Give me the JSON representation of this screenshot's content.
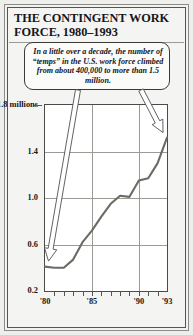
{
  "figure": {
    "title": "THE CONTINGENT WORK FORCE, 1980–1993",
    "callout": "In a little over a decade, the number of “temps” in the U.S. work force climbed from about 400,000 to more than 1.5 million.",
    "background_color": "#f2f2f0",
    "plot_background_color": "#ffffff",
    "line_color": "#6b6b66",
    "grid_color": "#9b9b96",
    "frame_color": "#55554f"
  },
  "chart_data": {
    "type": "line",
    "title": "THE CONTINGENT WORK FORCE, 1980–1993",
    "xlabel": "",
    "ylabel": "1.8 millions",
    "ylim": [
      0.2,
      1.8
    ],
    "xlim": [
      1980,
      1993
    ],
    "grid": true,
    "legend": null,
    "y_ticks": [
      1.8,
      1.4,
      1.0,
      0.6,
      0.2
    ],
    "y_tick_labels": [
      "1.8 millions",
      "1.4",
      "1.0",
      "0.6",
      "0.2"
    ],
    "x_ticks": [
      1980,
      1981,
      1982,
      1983,
      1984,
      1985,
      1986,
      1987,
      1988,
      1989,
      1990,
      1991,
      1992,
      1993
    ],
    "x_tick_labels": [
      "'80",
      "",
      "",
      "",
      "",
      "'85",
      "",
      "",
      "",
      "",
      "'90",
      "",
      "",
      "'93"
    ],
    "x_labeled": [
      {
        "year": 1980,
        "label": "'80"
      },
      {
        "year": 1985,
        "label": "'85"
      },
      {
        "year": 1990,
        "label": "'90"
      },
      {
        "year": 1993,
        "label": "'93"
      }
    ],
    "gridlines_v_years": [
      1985,
      1990
    ],
    "x": [
      1980,
      1981,
      1982,
      1983,
      1984,
      1985,
      1986,
      1987,
      1988,
      1989,
      1990,
      1991,
      1992,
      1993
    ],
    "values": [
      0.41,
      0.4,
      0.4,
      0.47,
      0.62,
      0.72,
      0.84,
      0.95,
      1.02,
      1.01,
      1.15,
      1.17,
      1.3,
      1.52
    ],
    "series": [
      {
        "name": "Temporary workers in U.S. work force (millions)",
        "values": [
          0.41,
          0.4,
          0.4,
          0.47,
          0.62,
          0.72,
          0.84,
          0.95,
          1.02,
          1.01,
          1.15,
          1.17,
          1.3,
          1.52
        ]
      }
    ],
    "annotations": [
      {
        "text": "In a little over a decade, the number of “temps” in the U.S. work force climbed from about 400,000 to more than 1.5 million.",
        "arrows": [
          {
            "name": "arrow-to-start",
            "points_to_year": 1980,
            "points_to_value": 0.41
          },
          {
            "name": "arrow-to-end",
            "points_to_year": 1993,
            "points_to_value": 1.52
          }
        ]
      }
    ]
  }
}
